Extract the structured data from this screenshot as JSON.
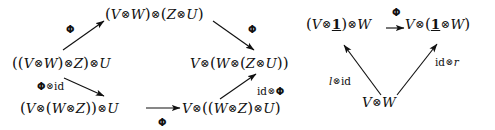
{
  "figure": {
    "kind": "commutative-diagram-pair",
    "background_color": "#ffffff",
    "ink_color": "#111111"
  },
  "symbols": {
    "tensor": "⊗",
    "arrowhead": "▶",
    "phi": "Φ",
    "identity": "id",
    "unit_object": "1",
    "left_unitor": "l",
    "right_unitor": "r"
  },
  "pentagon": {
    "name": "associativity-pentagon",
    "nodes": [
      {
        "id": "top",
        "text": "(V⊗W)⊗(Z⊗U)"
      },
      {
        "id": "left",
        "text": "((V⊗W)⊗Z)⊗U"
      },
      {
        "id": "right",
        "text": "V⊗(W⊗(Z⊗U))"
      },
      {
        "id": "bottom-left",
        "text": "(V⊗(W⊗Z))⊗U"
      },
      {
        "id": "bottom-right",
        "text": "V⊗((W⊗Z)⊗U)"
      }
    ],
    "edges": [
      {
        "id": "left-to-top",
        "from": "left",
        "to": "top",
        "label": "Φ"
      },
      {
        "id": "top-to-right",
        "from": "top",
        "to": "right",
        "label": "Φ"
      },
      {
        "id": "left-to-bottom-left",
        "from": "left",
        "to": "bottom-left",
        "label": "Φ⊗id"
      },
      {
        "id": "bottom-left-to-bottom-right",
        "from": "bottom-left",
        "to": "bottom-right",
        "label": "Φ"
      },
      {
        "id": "bottom-right-to-right",
        "from": "bottom-right",
        "to": "right",
        "label": "id⊗Φ"
      }
    ]
  },
  "triangle": {
    "name": "unit-triangle",
    "nodes": [
      {
        "id": "top-left",
        "text": "(V⊗1)⊗W"
      },
      {
        "id": "top-right",
        "text": "V⊗(1⊗W)"
      },
      {
        "id": "bottom",
        "text": "V⊗W"
      }
    ],
    "edges": [
      {
        "id": "top-left-to-top-right",
        "from": "top-left",
        "to": "top-right",
        "label": "Φ"
      },
      {
        "id": "bottom-to-top-left",
        "from": "bottom",
        "to": "top-left",
        "label": "l⊗id"
      },
      {
        "id": "bottom-to-top-right",
        "from": "bottom",
        "to": "top-right",
        "label": "id⊗r"
      }
    ]
  }
}
